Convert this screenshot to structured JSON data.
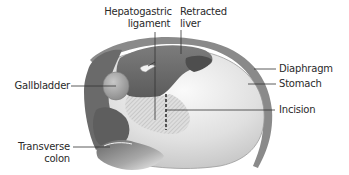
{
  "figure": {
    "colors": {
      "background": "#ffffff",
      "label_text": "#2a2a2a",
      "leader_line": "#333333",
      "liver": "#6e6e6e",
      "liver_dark": "#555555",
      "stomach": "#e2e2e2",
      "stomach_highlight": "#f5f5f5",
      "diaphragm": "#8a8a8a",
      "gallbladder": "#9c9c9c",
      "colon": "#7a7a7a",
      "hatch_area": "#cfcfcf"
    }
  },
  "labels": {
    "hepatogastric_line1": "Hepatogastric",
    "hepatogastric_line2": "ligament",
    "retracted_line1": "Retracted",
    "retracted_line2": "liver",
    "gallbladder": "Gallbladder",
    "diaphragm": "Diaphragm",
    "stomach": "Stomach",
    "incision": "Incision",
    "transverse_line1": "Transverse",
    "transverse_line2": "colon"
  }
}
